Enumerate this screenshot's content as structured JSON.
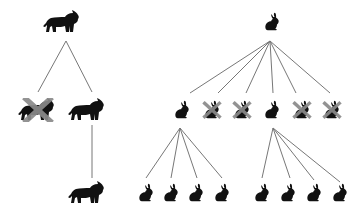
{
  "colors": {
    "animal": "#111111",
    "line": "#777777",
    "cross": "#8a8a8a",
    "background": "#ffffff"
  },
  "trees": [
    {
      "species": "lion",
      "root": {
        "x": 63,
        "y": 22
      },
      "level2": [
        {
          "x": 38,
          "y": 110,
          "eliminated": true
        },
        {
          "x": 88,
          "y": 110,
          "eliminated": false
        }
      ],
      "level3": [
        {
          "x": 88,
          "y": 193,
          "parent": 1
        }
      ]
    },
    {
      "species": "rabbit",
      "root": {
        "x": 272,
        "y": 22
      },
      "level2": [
        {
          "x": 182,
          "y": 110,
          "eliminated": false
        },
        {
          "x": 212,
          "y": 110,
          "eliminated": true
        },
        {
          "x": 242,
          "y": 110,
          "eliminated": true
        },
        {
          "x": 272,
          "y": 110,
          "eliminated": false
        },
        {
          "x": 302,
          "y": 110,
          "eliminated": true
        },
        {
          "x": 332,
          "y": 110,
          "eliminated": true
        }
      ],
      "level3": [
        {
          "x": 146,
          "y": 193,
          "parent": 0
        },
        {
          "x": 171,
          "y": 193,
          "parent": 0
        },
        {
          "x": 196,
          "y": 193,
          "parent": 0
        },
        {
          "x": 222,
          "y": 193,
          "parent": 0
        },
        {
          "x": 262,
          "y": 193,
          "parent": 3
        },
        {
          "x": 288,
          "y": 193,
          "parent": 3
        },
        {
          "x": 314,
          "y": 193,
          "parent": 3
        },
        {
          "x": 340,
          "y": 193,
          "parent": 3
        }
      ]
    }
  ]
}
